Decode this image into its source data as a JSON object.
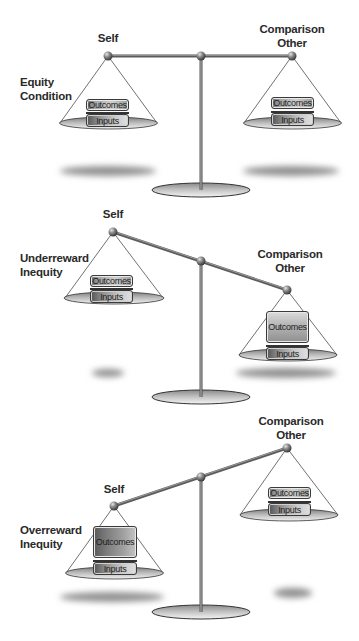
{
  "diagram": {
    "type": "balance-scale-equity-theory",
    "colors": {
      "background": "#ffffff",
      "text": "#2a2a2a",
      "beam": "#7a7a7a",
      "pan": "#b0b0b0",
      "shadow": "#9a9a9a"
    },
    "panels": [
      {
        "id": "equity",
        "condition_label": [
          "Equity",
          "Condition"
        ],
        "left_label": "Self",
        "right_label": [
          "Comparison",
          "Other"
        ],
        "left": {
          "outcomes": "Outcomes",
          "inputs": "Inputs",
          "outcomes_size": "normal"
        },
        "right": {
          "outcomes": "Outcomes",
          "inputs": "Inputs",
          "outcomes_size": "normal"
        },
        "tilt": "level"
      },
      {
        "id": "underreward",
        "condition_label": [
          "Underreward",
          "Inequity"
        ],
        "left_label": "Self",
        "right_label": [
          "Comparison",
          "Other"
        ],
        "left": {
          "outcomes": "Outcomes",
          "inputs": "Inputs",
          "outcomes_size": "normal"
        },
        "right": {
          "outcomes": "Outcomes",
          "inputs": "Inputs",
          "outcomes_size": "large"
        },
        "tilt": "right-down"
      },
      {
        "id": "overreward",
        "condition_label": [
          "Overreward",
          "Inequity"
        ],
        "left_label": "Self",
        "right_label": [
          "Comparison",
          "Other"
        ],
        "left": {
          "outcomes": "Outcomes",
          "inputs": "Inputs",
          "outcomes_size": "large"
        },
        "right": {
          "outcomes": "Outcomes",
          "inputs": "Inputs",
          "outcomes_size": "normal"
        },
        "tilt": "left-down"
      }
    ]
  }
}
